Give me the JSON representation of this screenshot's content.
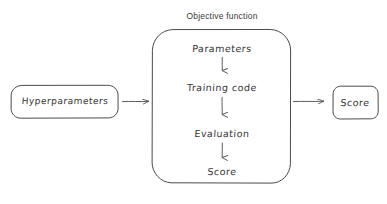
{
  "diagram": {
    "type": "flow-diagram",
    "style": "hand-drawn sketch",
    "background_color": "#ffffff",
    "stroke_color": "#4a4a4a",
    "text_color": "#333333",
    "title": "Objective function",
    "nodes": {
      "input_box": {
        "label": "Hyperparameters",
        "shape": "rounded-rectangle"
      },
      "objective_box": {
        "label": "Objective function",
        "shape": "rounded-rectangle-large"
      },
      "output_box": {
        "label": "Score",
        "shape": "rounded-rectangle"
      }
    },
    "inner_steps": [
      {
        "label": "Parameters"
      },
      {
        "label": "Training code"
      },
      {
        "label": "Evaluation"
      },
      {
        "label": "Score"
      }
    ],
    "connectors": [
      {
        "name": "input-to-objective",
        "direction": "right"
      },
      {
        "name": "parameters-to-training-code",
        "direction": "down"
      },
      {
        "name": "training-code-to-evaluation",
        "direction": "down"
      },
      {
        "name": "evaluation-to-score",
        "direction": "down"
      },
      {
        "name": "objective-to-output",
        "direction": "right"
      }
    ]
  }
}
